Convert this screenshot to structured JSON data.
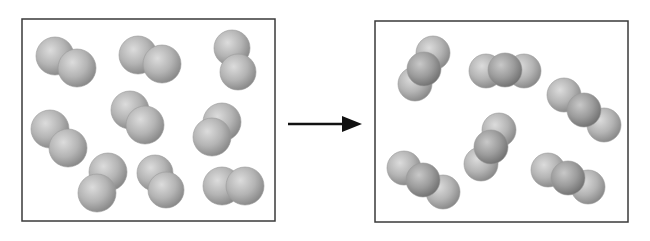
{
  "diagram": {
    "colors": {
      "border": "#3a3a3a",
      "atom_light": "#d8d8d8",
      "atom_mid": "#a9a9a9",
      "atom_dark": "#7a7a7a",
      "arrow": "#111111"
    },
    "left_box": {
      "label": "reactants",
      "x": 22,
      "y": 19,
      "w": 253,
      "h": 202,
      "molecules": [
        {
          "atoms": [
            [
              55,
              56,
              19
            ],
            [
              77,
              68,
              19
            ]
          ]
        },
        {
          "atoms": [
            [
              138,
              55,
              19
            ],
            [
              162,
              64,
              19
            ]
          ]
        },
        {
          "atoms": [
            [
              232,
              48,
              18
            ],
            [
              238,
              72,
              18
            ]
          ]
        },
        {
          "atoms": [
            [
              50,
              129,
              19
            ],
            [
              68,
              148,
              19
            ]
          ]
        },
        {
          "atoms": [
            [
              130,
              110,
              19
            ],
            [
              145,
              125,
              19
            ]
          ]
        },
        {
          "atoms": [
            [
              222,
              122,
              19
            ],
            [
              212,
              137,
              19
            ]
          ]
        },
        {
          "atoms": [
            [
              108,
              172,
              19
            ],
            [
              97,
              193,
              19
            ]
          ]
        },
        {
          "atoms": [
            [
              155,
              173,
              18
            ],
            [
              166,
              190,
              18
            ]
          ]
        },
        {
          "atoms": [
            [
              222,
              186,
              19
            ],
            [
              245,
              186,
              19
            ]
          ]
        }
      ]
    },
    "arrow": {
      "x1": 288,
      "y1": 124,
      "x2": 362,
      "y2": 124
    },
    "right_box": {
      "label": "products",
      "x": 375,
      "y": 21,
      "w": 253,
      "h": 201,
      "molecules": [
        {
          "atoms": [
            [
              415,
              84,
              17
            ],
            [
              433,
              53,
              17
            ],
            [
              424,
              69,
              17
            ]
          ]
        },
        {
          "atoms": [
            [
              486,
              71,
              17
            ],
            [
              524,
              71,
              17
            ],
            [
              505,
              70,
              17
            ]
          ]
        },
        {
          "atoms": [
            [
              564,
              95,
              17
            ],
            [
              604,
              125,
              17
            ],
            [
              584,
              110,
              17
            ]
          ]
        },
        {
          "atoms": [
            [
              481,
              164,
              17
            ],
            [
              499,
              130,
              17
            ],
            [
              491,
              147,
              17
            ]
          ]
        },
        {
          "atoms": [
            [
              404,
              168,
              17
            ],
            [
              443,
              192,
              17
            ],
            [
              423,
              180,
              17
            ]
          ]
        },
        {
          "atoms": [
            [
              548,
              170,
              17
            ],
            [
              588,
              187,
              17
            ],
            [
              568,
              178,
              17
            ]
          ]
        }
      ]
    }
  }
}
